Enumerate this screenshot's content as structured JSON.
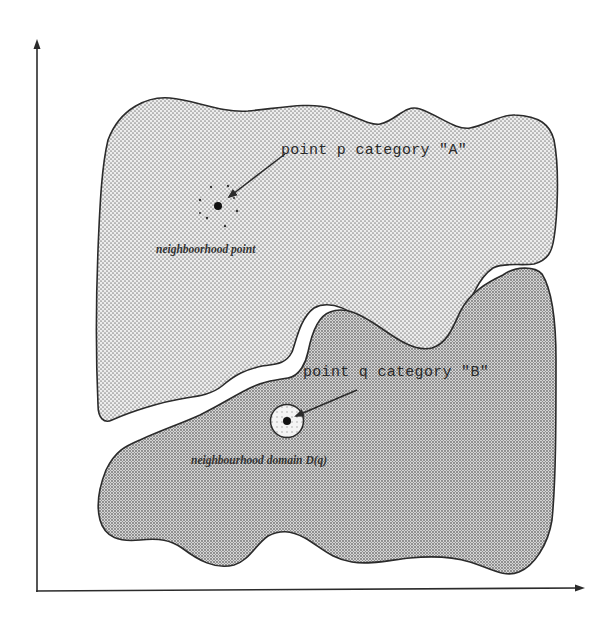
{
  "figure": {
    "type": "set-diagram",
    "axes": {
      "x_axis": {
        "has_arrow": true,
        "label": ""
      },
      "y_axis": {
        "has_arrow": true,
        "label": ""
      }
    },
    "regions": [
      {
        "id": "A",
        "name": "category A region",
        "fill": "light-dotted",
        "fill_color": "#e6e6e6",
        "dot_color": "#8a8a8a"
      },
      {
        "id": "B",
        "name": "category B region",
        "fill": "dense-dotted",
        "fill_color": "#cfcfcf",
        "dot_color": "#6f6f6f"
      }
    ],
    "labels": {
      "point_p": "point p  category \"A\"",
      "neighborhood_point": "neighboorhood point",
      "point_q": "point q  category \"B\"",
      "neighborhood_domain": "neighbourhood domain D(q)"
    },
    "points": [
      {
        "name": "p",
        "category": "A",
        "marker": "solid-dot",
        "surrounded_by": "scattered neighborhood points"
      },
      {
        "name": "q",
        "category": "B",
        "marker": "solid-dot",
        "surrounded_by": "circular neighborhood domain D(q)"
      }
    ],
    "colors": {
      "stroke": "#2b2b2b",
      "background": "#ffffff",
      "region_a_bg": "#e9e9e9",
      "region_b_bg": "#d2d2d2"
    }
  }
}
